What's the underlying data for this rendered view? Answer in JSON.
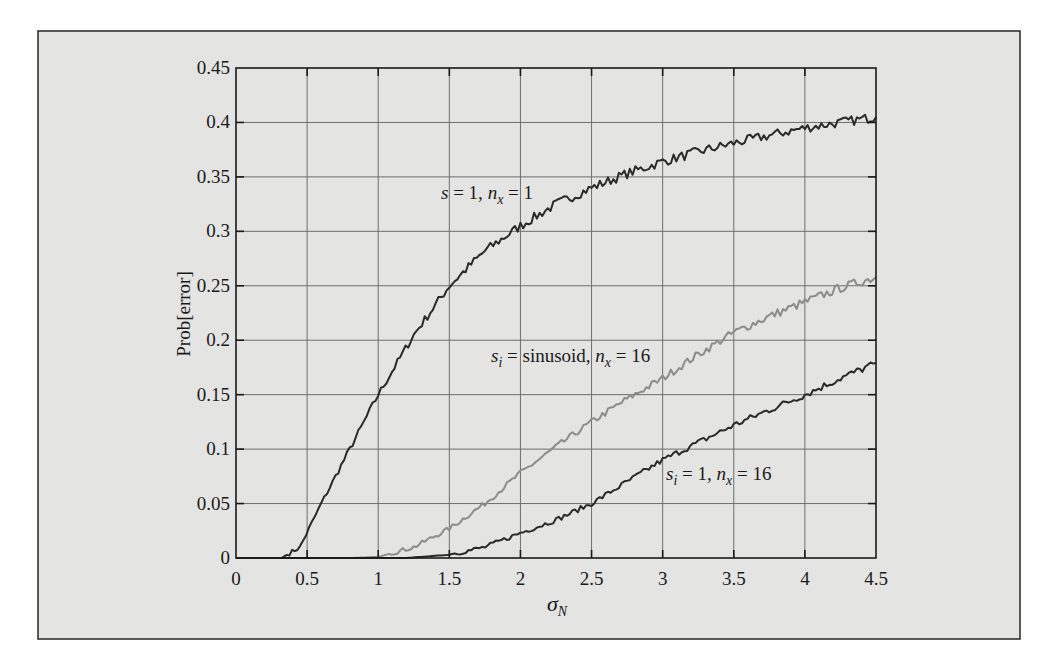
{
  "chart_data": {
    "type": "line",
    "title": "",
    "xlabel": "σ_N",
    "xlabel_main": "σ",
    "xlabel_sub": "N",
    "ylabel": "Prob[error]",
    "xlim": [
      0,
      4.5
    ],
    "ylim": [
      0,
      0.45
    ],
    "grid": true,
    "legend": "inline annotations",
    "x_ticks": [
      "0",
      "0.5",
      "1",
      "1.5",
      "2",
      "2.5",
      "3",
      "3.5",
      "4",
      "4.5"
    ],
    "y_ticks": [
      "0",
      "0.05",
      "0.1",
      "0.15",
      "0.2",
      "0.25",
      "0.3",
      "0.35",
      "0.4",
      "0.45"
    ],
    "x_tick_values": [
      0,
      0.5,
      1,
      1.5,
      2,
      2.5,
      3,
      3.5,
      4,
      4.5
    ],
    "y_tick_values": [
      0,
      0.05,
      0.1,
      0.15,
      0.2,
      0.25,
      0.3,
      0.35,
      0.4,
      0.45
    ],
    "series": [
      {
        "name": "s = 1, n_x = 1",
        "color": "#2a2a2a",
        "x": [
          0,
          0.32,
          0.45,
          0.6,
          0.8,
          1.0,
          1.25,
          1.5,
          1.75,
          2.0,
          2.25,
          2.5,
          2.75,
          3.0,
          3.25,
          3.5,
          3.75,
          4.0,
          4.25,
          4.5
        ],
        "values": [
          0,
          0,
          0.01,
          0.05,
          0.1,
          0.15,
          0.205,
          0.25,
          0.282,
          0.305,
          0.325,
          0.34,
          0.353,
          0.364,
          0.373,
          0.381,
          0.388,
          0.395,
          0.4,
          0.405
        ]
      },
      {
        "name": "s_i = sinusoid, n_x = 16",
        "color": "#8c8c8c",
        "x": [
          0,
          0.8,
          1.0,
          1.25,
          1.5,
          1.75,
          2.0,
          2.25,
          2.5,
          2.75,
          3.0,
          3.25,
          3.5,
          3.75,
          4.0,
          4.25,
          4.5
        ],
        "values": [
          0,
          0,
          0.001,
          0.01,
          0.027,
          0.05,
          0.078,
          0.102,
          0.125,
          0.146,
          0.165,
          0.187,
          0.207,
          0.222,
          0.235,
          0.248,
          0.258
        ]
      },
      {
        "name": "s_i = 1, n_x = 16",
        "color": "#2a2a2a",
        "x": [
          0,
          1.2,
          1.5,
          1.75,
          2.0,
          2.25,
          2.5,
          2.75,
          3.0,
          3.25,
          3.5,
          3.75,
          4.0,
          4.25,
          4.5
        ],
        "values": [
          0,
          0,
          0.003,
          0.01,
          0.023,
          0.035,
          0.05,
          0.07,
          0.09,
          0.106,
          0.122,
          0.136,
          0.15,
          0.165,
          0.179
        ]
      }
    ],
    "annotations": [
      {
        "main": "s",
        "sub": "",
        "rest": " = 1, ",
        "main2": "n",
        "sub2": "x",
        "rest2": " = 1",
        "x_px": 441,
        "y_px": 199
      },
      {
        "main": "s",
        "sub": "i",
        "rest": " = sinusoid, ",
        "main2": "n",
        "sub2": "x",
        "rest2": " = 16",
        "x_px": 491,
        "y_px": 362
      },
      {
        "main": "s",
        "sub": "i",
        "rest": " = 1, ",
        "main2": "n",
        "sub2": "x",
        "rest2": " = 16",
        "x_px": 666,
        "y_px": 480
      }
    ]
  },
  "style": {
    "page_bg": "#ffffff",
    "frame_bg": "#e4e4e2",
    "frame_border": "#333333",
    "grid_color": "#6e6e6e",
    "axis_color": "#1a1a1a"
  }
}
